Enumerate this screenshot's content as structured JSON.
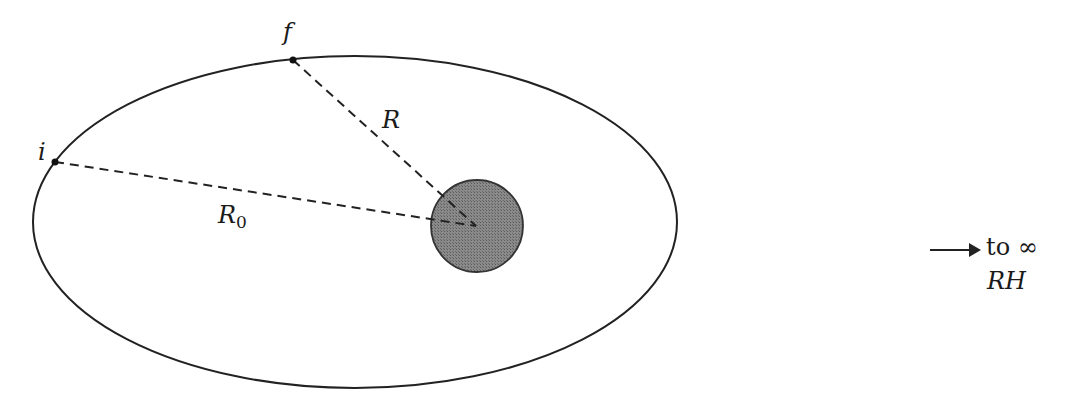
{
  "diagram": {
    "points": [
      {
        "id": "f",
        "label": "f"
      },
      {
        "id": "i",
        "label": "i"
      }
    ],
    "radii": {
      "R": {
        "label": "R"
      },
      "R0": {
        "label": "R",
        "subscript": "0"
      }
    },
    "central_body": {
      "fill": "#7a7a7a",
      "stroke": "#333333"
    },
    "orbit": {
      "stroke": "#222222"
    },
    "annotation": {
      "arrow_text": "to ∞",
      "region_label": "RH"
    }
  }
}
